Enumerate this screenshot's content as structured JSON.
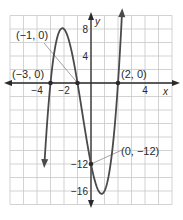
{
  "chart_data": {
    "type": "line",
    "title": "",
    "xlabel": "x",
    "ylabel": "y",
    "xlim": [
      -6,
      6
    ],
    "ylim": [
      -18,
      10
    ],
    "grid": true,
    "grid_step": {
      "x": 1,
      "y": 2
    },
    "x_ticks": [
      {
        "value": -4,
        "label": "−4"
      },
      {
        "value": -2,
        "label": "−2"
      },
      {
        "value": 4,
        "label": "4"
      }
    ],
    "y_ticks": [
      {
        "value": 8,
        "label": "8"
      },
      {
        "value": 4,
        "label": "4"
      },
      {
        "value": -12,
        "label": "−12"
      },
      {
        "value": -16,
        "label": "−16"
      }
    ],
    "series": [
      {
        "name": "cubic",
        "function": "2(x+3)(x+1)(x-2)",
        "coefficients": [
          2,
          4,
          -10,
          -12
        ],
        "x_range": [
          -3.45,
          2.3
        ],
        "arrows_both_ends": true
      }
    ],
    "points": [
      {
        "x": -3,
        "y": 0,
        "label": "(−3, 0)"
      },
      {
        "x": -1,
        "y": 0,
        "label": "(−1, 0)"
      },
      {
        "x": 2,
        "y": 0,
        "label": "(2, 0)"
      },
      {
        "x": 0,
        "y": -12,
        "label": "(0, −12)"
      }
    ],
    "colors": {
      "curve": "#4a4a4a",
      "axis": "#2a2a2a",
      "grid": "#c8c8c8",
      "leader": "#8a8a8a"
    }
  }
}
